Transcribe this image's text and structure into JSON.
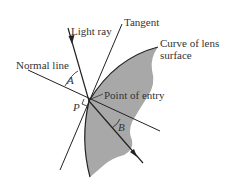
{
  "diagram": {
    "labels": {
      "light_ray": "Light ray",
      "tangent": "Tangent",
      "curve_line1": "Curve of lens",
      "curve_line2": "surface",
      "normal_line": "Normal line",
      "point_of_entry": "Point of entry",
      "angle_a": "A",
      "angle_b": "B",
      "perpendicular": "P"
    },
    "colors": {
      "lens_fill": "#a8a8a8",
      "line": "#222222",
      "text": "#333333"
    }
  }
}
